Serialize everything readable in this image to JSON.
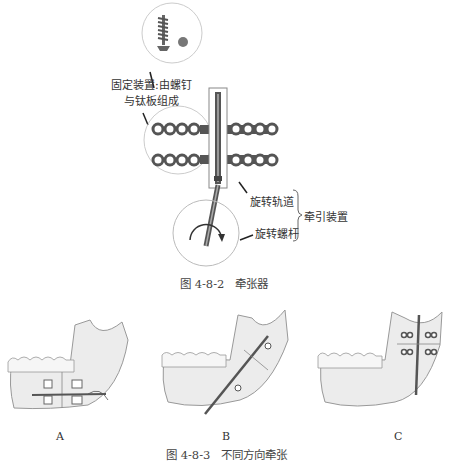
{
  "figure_top": {
    "caption": "图 4-8-2　牵张器",
    "labels": {
      "fixing_device_line1": "固定装置:由螺钉",
      "fixing_device_line2": "与钛板组成",
      "rotation_track": "旋转轨道",
      "rotation_screw": "旋转螺杆",
      "traction_device": "牵引装置"
    }
  },
  "figure_bottom": {
    "caption": "图 4-8-3　不同方向牵张",
    "panels": [
      {
        "id": "A",
        "label": "A"
      },
      {
        "id": "B",
        "label": "B"
      },
      {
        "id": "C",
        "label": "C"
      }
    ]
  },
  "colors": {
    "line": "#444444",
    "plate": "#555555",
    "bone": "#e8e8e8",
    "circle": "#cccccc"
  }
}
